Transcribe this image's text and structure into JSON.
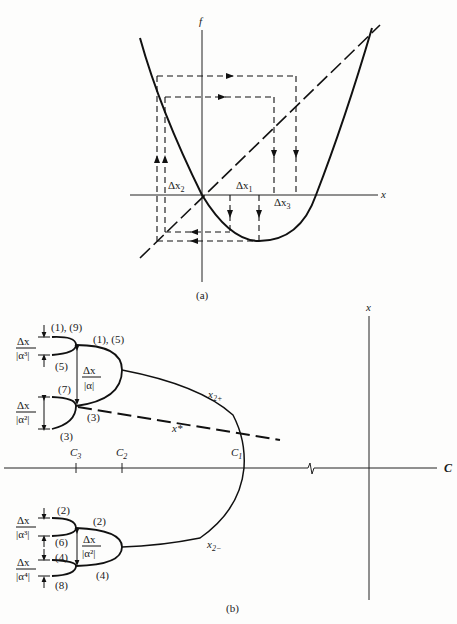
{
  "figure": {
    "panel_a": {
      "caption": "(a)",
      "axes": {
        "vertical_label": "f",
        "horizontal_label": "x"
      },
      "labels": {
        "dx1": {
          "delta": "Δx",
          "sub": "1"
        },
        "dx2": {
          "delta": "Δx",
          "sub": "2"
        },
        "dx3": {
          "delta": "Δx",
          "sub": "3"
        }
      },
      "description": "Parabola f(x) with 45° dashed identity line; cobweb dashed paths with arrows"
    },
    "panel_b": {
      "caption": "(b)",
      "axes": {
        "vertical_label": "x",
        "horizontal_label": "C"
      },
      "ticks": {
        "c3": {
          "name": "C",
          "sub": "3"
        },
        "c2": {
          "name": "C",
          "sub": "2"
        },
        "c1": {
          "name": "C",
          "sub": "1"
        }
      },
      "branch_labels": {
        "x2plus": {
          "name": "x",
          "sub": "2+"
        },
        "x2minus": {
          "name": "x",
          "sub": "2−"
        },
        "xstar": "x*"
      },
      "orbit_labels": {
        "l1_9": "(1), (9)",
        "l1_5": "(1), (5)",
        "l5": "(5)",
        "l7": "(7)",
        "l3a": "(3)",
        "l3b": "(3)",
        "l2a": "(2)",
        "l2b": "(2)",
        "l6": "(6)",
        "l4a": "(4)",
        "l4b": "(4)",
        "l8": "(8)"
      },
      "fractions": {
        "a3_top": {
          "num": "Δx",
          "den": "|α³|"
        },
        "a1": {
          "num": "Δx",
          "den": "|α|"
        },
        "a2_top": {
          "num": "Δx",
          "den": "|α²|"
        },
        "a3_bot": {
          "num": "Δx",
          "den": "|α³|"
        },
        "a2_bot": {
          "num": "Δx",
          "den": "|α²|"
        },
        "a4_bot": {
          "num": "Δx",
          "den": "|α⁴|"
        }
      }
    }
  }
}
